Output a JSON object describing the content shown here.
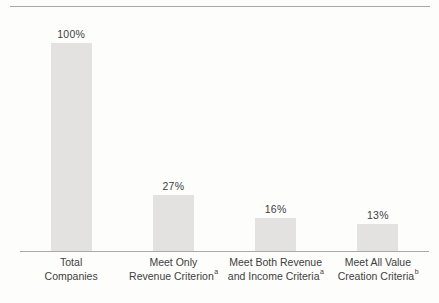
{
  "chart_data": {
    "type": "bar",
    "title": "",
    "xlabel": "",
    "ylabel": "",
    "ylim": [
      0,
      100
    ],
    "grid": false,
    "legend": "none",
    "categories": [
      {
        "line1": "Total",
        "line2": "Companies",
        "superscript": ""
      },
      {
        "line1": "Meet Only",
        "line2": "Revenue Criterion",
        "superscript": "a"
      },
      {
        "line1": "Meet Both Revenue",
        "line2": "and Income Criteria",
        "superscript": "a"
      },
      {
        "line1": "Meet All Value",
        "line2": "Creation Criteria",
        "superscript": "b"
      }
    ],
    "values": [
      100,
      27,
      16,
      13
    ],
    "value_labels": [
      "100%",
      "27%",
      "16%",
      "13%"
    ],
    "colors": {
      "bar": "#e3e2e0",
      "axis_line": "#a9a9a9",
      "top_rule": "#a9a9a9",
      "text": "#3d3d3d",
      "background": "#fdfdfc"
    }
  }
}
